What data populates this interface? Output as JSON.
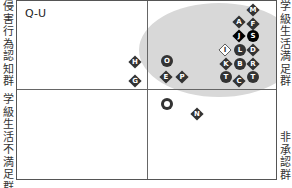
{
  "chart_data": {
    "type": "scatter",
    "title": "Q-U",
    "quadrant_labels": {
      "left_top": "侵害行為認知群",
      "left_bottom": "学級生活不満足群",
      "right_top": "学級生活満足群",
      "right_bottom": "非承認群"
    },
    "grid": false,
    "legend": "none",
    "highlight_region": {
      "shape": "ellipse",
      "color": "#d8d8d8",
      "cx": 219,
      "cy": 50,
      "rx": 80,
      "ry": 47
    },
    "points": [
      {
        "label": "M",
        "x": 253,
        "y": 10,
        "shape": "diamond",
        "fill": "dark"
      },
      {
        "label": "A",
        "x": 239,
        "y": 22,
        "shape": "diamond",
        "fill": "dark"
      },
      {
        "label": "F",
        "x": 253,
        "y": 24,
        "shape": "diamond",
        "fill": "dark"
      },
      {
        "label": "J",
        "x": 239,
        "y": 36,
        "shape": "diamond",
        "fill": "black"
      },
      {
        "label": "S",
        "x": 253,
        "y": 36,
        "shape": "circle",
        "fill": "black"
      },
      {
        "label": "I",
        "x": 225,
        "y": 50,
        "shape": "diamond",
        "fill": "white"
      },
      {
        "label": "L",
        "x": 240,
        "y": 50,
        "shape": "circle",
        "fill": "dark"
      },
      {
        "label": "D",
        "x": 253,
        "y": 50,
        "shape": "diamond",
        "fill": "dark"
      },
      {
        "label": "K",
        "x": 226,
        "y": 64,
        "shape": "diamond",
        "fill": "dark"
      },
      {
        "label": "B",
        "x": 240,
        "y": 64,
        "shape": "circle",
        "fill": "dark"
      },
      {
        "label": "R",
        "x": 253,
        "y": 64,
        "shape": "diamond",
        "fill": "dark"
      },
      {
        "label": "T",
        "x": 226,
        "y": 77,
        "shape": "circle",
        "fill": "dark"
      },
      {
        "label": "C",
        "x": 239,
        "y": 81,
        "shape": "diamond",
        "fill": "dark"
      },
      {
        "label": "T",
        "x": 253,
        "y": 77,
        "shape": "circle",
        "fill": "dark"
      },
      {
        "label": "O",
        "x": 167,
        "y": 61,
        "shape": "circle",
        "fill": "dark"
      },
      {
        "label": "E",
        "x": 166,
        "y": 77,
        "shape": "diamond",
        "fill": "dark"
      },
      {
        "label": "P",
        "x": 182,
        "y": 77,
        "shape": "diamond",
        "fill": "dark"
      },
      {
        "label": "H",
        "x": 135,
        "y": 62,
        "shape": "diamond",
        "fill": "dark"
      },
      {
        "label": "G",
        "x": 135,
        "y": 81,
        "shape": "diamond",
        "fill": "dark"
      },
      {
        "label": "Q",
        "x": 167,
        "y": 104,
        "shape": "circle",
        "fill": "ring"
      },
      {
        "label": "N",
        "x": 197,
        "y": 114,
        "shape": "diamond",
        "fill": "dark"
      }
    ]
  }
}
